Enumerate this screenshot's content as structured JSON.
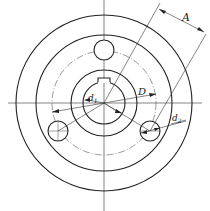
{
  "drawing": {
    "type": "flange-plate-technical-drawing",
    "labels": {
      "A": "A",
      "D": "D",
      "d1_main": "d",
      "d1_sub": "1",
      "d2_main": "d",
      "d2_sub": "2"
    },
    "colors": {
      "line": "#222222",
      "background": "#ffffff"
    }
  }
}
